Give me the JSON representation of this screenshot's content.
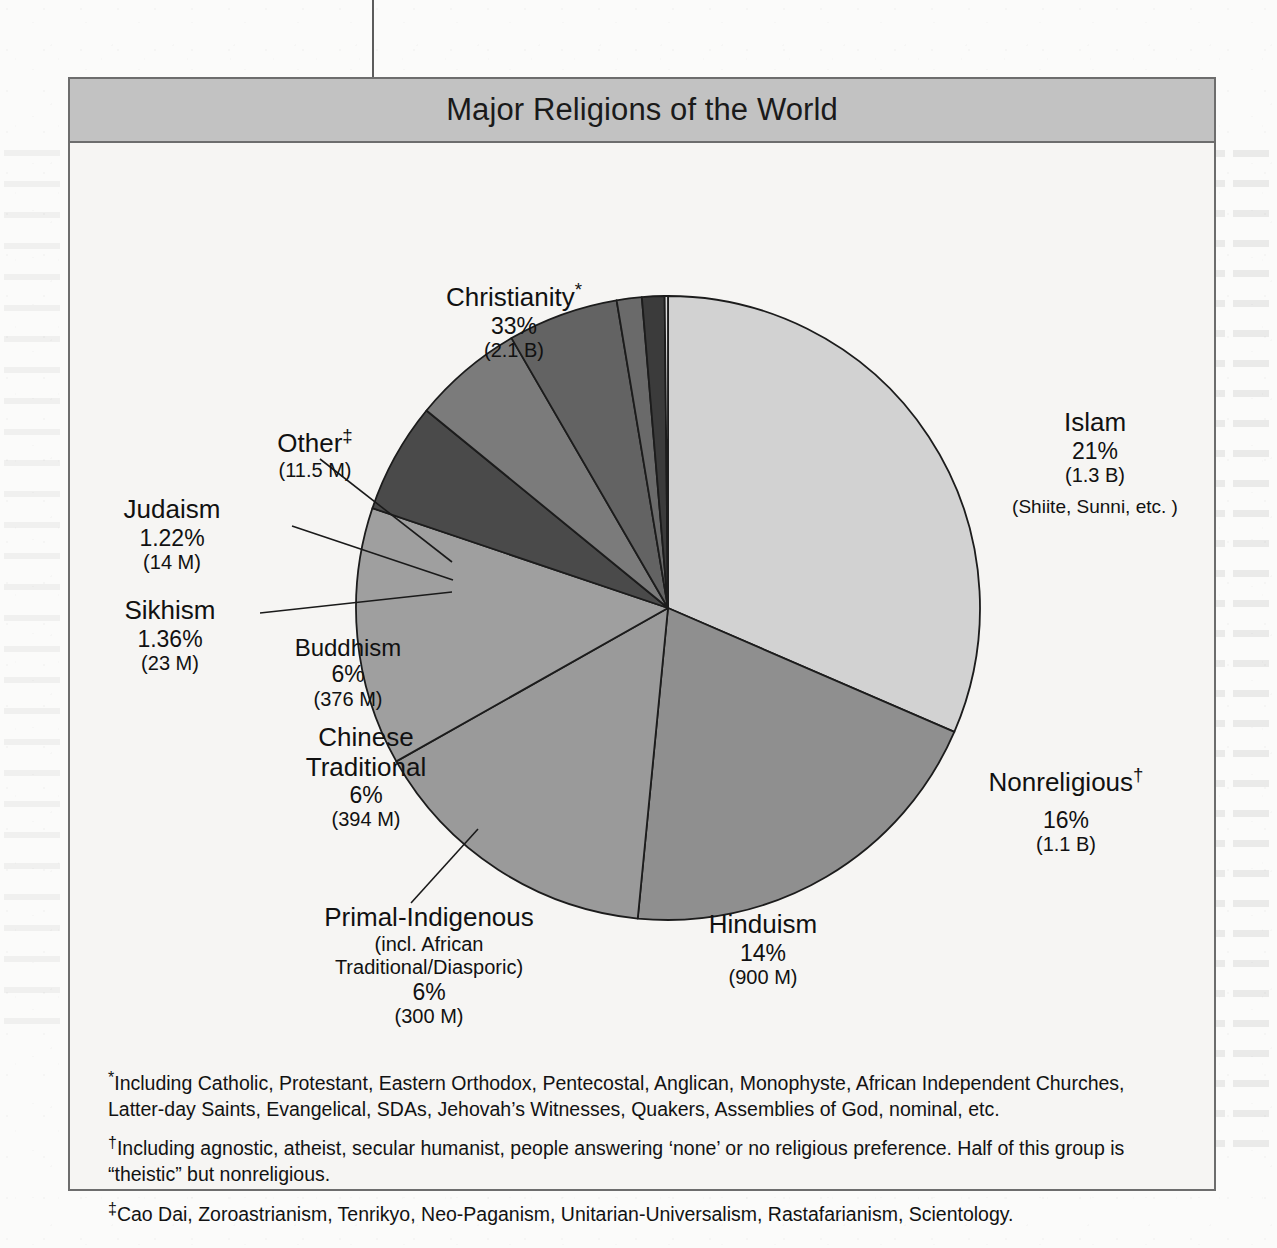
{
  "figure": {
    "title": "Major Religions of the World"
  },
  "chart_data": {
    "type": "pie",
    "title": "Major Religions of the World",
    "legend_position": "callout-labels",
    "grid": false,
    "units": "percent of world population",
    "start_angle_deg": 0,
    "direction": "clockwise",
    "categories": [
      "Christianity",
      "Islam",
      "Nonreligious",
      "Hinduism",
      "Primal-Indigenous",
      "Chinese Traditional",
      "Buddhism",
      "Sikhism",
      "Judaism",
      "Other"
    ],
    "values": [
      33,
      21,
      16,
      14,
      6,
      6,
      6,
      1.36,
      1.22,
      0.18
    ],
    "slices": [
      {
        "key": "christianity",
        "name": "Christianity",
        "marker": "*",
        "percent_label": "33%",
        "count_label": "(2.1 B)",
        "value": 33,
        "color": "#d2d2d2"
      },
      {
        "key": "islam",
        "name": "Islam",
        "marker": "",
        "percent_label": "21%",
        "count_label": "(1.3 B)",
        "note": "(Shiite, Sunni, etc. )",
        "value": 21,
        "color": "#8f8f8f"
      },
      {
        "key": "nonreligious",
        "name": "Nonreligious",
        "marker": "†",
        "percent_label": "16%",
        "count_label": "(1.1 B)",
        "value": 16,
        "color": "#9a9a9a"
      },
      {
        "key": "hinduism",
        "name": "Hinduism",
        "marker": "",
        "percent_label": "14%",
        "count_label": "(900 M)",
        "value": 14,
        "color": "#9f9f9f"
      },
      {
        "key": "primal_indigenous",
        "name": "Primal-Indigenous",
        "marker": "",
        "sub1": "(incl. African",
        "sub2": "Traditional/Diasporic)",
        "percent_label": "6%",
        "count_label": "(300 M)",
        "value": 6,
        "color": "#4a4a4a"
      },
      {
        "key": "chinese_traditional",
        "name1": "Chinese",
        "name2": "Traditional",
        "name": "Chinese Traditional",
        "marker": "",
        "percent_label": "6%",
        "count_label": "(394 M)",
        "value": 6,
        "color": "#7b7b7b"
      },
      {
        "key": "buddhism",
        "name": "Buddhism",
        "marker": "",
        "percent_label": "6%",
        "count_label": "(376 M)",
        "value": 6,
        "color": "#636363"
      },
      {
        "key": "sikhism",
        "name": "Sikhism",
        "marker": "",
        "percent_label": "1.36%",
        "count_label": "(23 M)",
        "value": 1.36,
        "color": "#6a6a6a"
      },
      {
        "key": "judaism",
        "name": "Judaism",
        "marker": "",
        "percent_label": "1.22%",
        "count_label": "(14 M)",
        "value": 1.22,
        "color": "#3b3b3b"
      },
      {
        "key": "other",
        "name": "Other",
        "marker": "‡",
        "percent_label": "",
        "count_label": "(11.5 M)",
        "value": 0.18,
        "color": "#dcdcdc"
      }
    ]
  },
  "footnotes": [
    {
      "marker": "*",
      "text": "Including Catholic, Protestant, Eastern Orthodox, Pentecostal, Anglican, Monophyste, African Independent Churches, Latter-day Saints, Evangelical, SDAs, Jehovah’s Witnesses, Quakers, Assemblies of God, nominal, etc."
    },
    {
      "marker": "†",
      "text": "Including agnostic, atheist, secular humanist, people answering ‘none’  or no religious preference.  Half of this group is “theistic” but nonreligious."
    },
    {
      "marker": "‡",
      "text": "Cao Dai, Zoroastrianism, Tenrikyo, Neo-Paganism, Unitarian-Universalism, Rastafarianism, Scientology."
    }
  ],
  "colors": {
    "frame": "#6d6d6d",
    "title_band": "#c2c2c2",
    "page_background": "#fbfbfa",
    "figure_background": "#f6f5f3"
  }
}
